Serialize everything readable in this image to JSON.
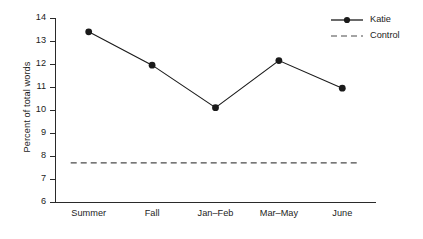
{
  "chart_data": {
    "type": "line",
    "title": "",
    "xlabel": "",
    "ylabel": "Percent of total words",
    "categories": [
      "Summer",
      "Fall",
      "Jan–Feb",
      "Mar–May",
      "June"
    ],
    "ylim": [
      6,
      14
    ],
    "yticks": [
      6,
      7,
      8,
      9,
      10,
      11,
      12,
      13,
      14
    ],
    "ytick_labels": [
      "6",
      "7",
      "8",
      "9",
      "10",
      "11",
      "12",
      "13",
      "14"
    ],
    "grid": false,
    "legend_position": "top-right",
    "series": [
      {
        "name": "Katie",
        "style": "solid",
        "marker": "filled-circle",
        "color": "#1a1a1a",
        "values": [
          13.4,
          11.95,
          10.1,
          12.15,
          10.95
        ]
      },
      {
        "name": "Control",
        "style": "dashed",
        "marker": "none",
        "color": "#4a4a4a",
        "constant_value": 7.7,
        "values": [
          7.7,
          7.7,
          7.7,
          7.7,
          7.7
        ]
      }
    ]
  },
  "legend": {
    "items": [
      {
        "label": "Katie"
      },
      {
        "label": "Control"
      }
    ]
  },
  "caption": {
    "sliver_text": ""
  }
}
